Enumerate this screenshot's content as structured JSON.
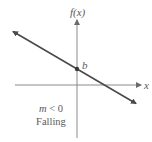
{
  "diagram": {
    "type": "linear-function-graph",
    "y_axis_label": "f(x)",
    "x_axis_label": "x",
    "intercept_label": "b",
    "slope_condition": "m < 0",
    "slope_description": "Falling",
    "colors": {
      "axis": "#8a8a8a",
      "line": "#4a4a4a",
      "point": "#3a3a3a",
      "text": "#5a5a5a"
    },
    "geometry": {
      "origin": [
        77,
        85
      ],
      "x_axis": {
        "from": [
          15,
          85
        ],
        "to": [
          142,
          85
        ]
      },
      "y_axis": {
        "from": [
          77,
          138
        ],
        "to": [
          77,
          19
        ]
      },
      "line": {
        "from": [
          12,
          31
        ],
        "to": [
          137,
          104
        ]
      },
      "intercept_point": [
        77,
        69
      ]
    }
  }
}
